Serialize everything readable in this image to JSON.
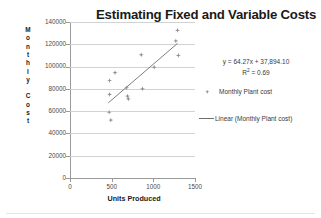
{
  "chart_data": {
    "type": "scatter",
    "title": "Estimating Fixed and Variable Costs",
    "xlabel": "Units Produced",
    "ylabel": "Monthly Cost",
    "xlim": [
      0,
      1500
    ],
    "ylim": [
      0,
      140000
    ],
    "xticks": [
      "0",
      "500",
      "1000",
      "1500"
    ],
    "yticks": [
      "0",
      "20000",
      "40000",
      "60000",
      "80000",
      "100000",
      "120000",
      "140000"
    ],
    "grid": true,
    "legend_position": "right",
    "series": [
      {
        "name": "Monthly Plant cost",
        "type": "scatter",
        "marker": "diamond",
        "color": "#8c8c8c",
        "points": [
          {
            "x": 470,
            "y": 59000
          },
          {
            "x": 475,
            "y": 75000
          },
          {
            "x": 475,
            "y": 87500
          },
          {
            "x": 490,
            "y": 52000
          },
          {
            "x": 540,
            "y": 94500
          },
          {
            "x": 680,
            "y": 81000
          },
          {
            "x": 690,
            "y": 73500
          },
          {
            "x": 700,
            "y": 71000
          },
          {
            "x": 855,
            "y": 110500
          },
          {
            "x": 870,
            "y": 80000
          },
          {
            "x": 1010,
            "y": 99500
          },
          {
            "x": 1270,
            "y": 123000
          },
          {
            "x": 1290,
            "y": 132500
          },
          {
            "x": 1300,
            "y": 110000
          }
        ]
      },
      {
        "name": "Linear (Monthly Plant cost)",
        "type": "line",
        "color": "#6e6e6e",
        "fit": {
          "slope": 64.27,
          "intercept": 37894.1,
          "r2": 0.69
        },
        "x_range": [
          460,
          1290
        ]
      }
    ],
    "annotations": {
      "equation": "y = 64.27x + 37,894.10",
      "r_squared_prefix": "R",
      "r_squared_sup": "2",
      "r_squared_value": " = 0.69"
    }
  },
  "legend": {
    "scatter_label": "Monthly Plant cost",
    "trend_label": "Linear (Monthly Plant cost)"
  },
  "axis_title_letters": {
    "monthly": [
      "M",
      "o",
      "n",
      "t",
      "h",
      "l",
      "y"
    ],
    "cost": [
      "C",
      "o",
      "s",
      "t"
    ]
  }
}
